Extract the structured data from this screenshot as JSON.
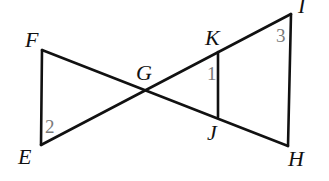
{
  "diagram": {
    "type": "geometry-figure",
    "colors": {
      "line": "#111111",
      "angle_label": "#7a7a7a",
      "background": "#ffffff"
    },
    "points": {
      "F": {
        "label": "F",
        "x": 42,
        "y": 50
      },
      "E": {
        "label": "E",
        "x": 41,
        "y": 145
      },
      "G": {
        "label": "G",
        "x": 146,
        "y": 89
      },
      "K": {
        "label": "K",
        "x": 218,
        "y": 52
      },
      "J": {
        "label": "J",
        "x": 218,
        "y": 117
      },
      "I": {
        "label": "I",
        "x": 291,
        "y": 14
      },
      "H": {
        "label": "H",
        "x": 288,
        "y": 146
      }
    },
    "segments": [
      {
        "from": "F",
        "to": "E"
      },
      {
        "from": "F",
        "to": "H"
      },
      {
        "from": "E",
        "to": "I"
      },
      {
        "from": "K",
        "to": "J"
      },
      {
        "from": "I",
        "to": "H"
      }
    ],
    "angles": [
      {
        "label": "1",
        "at": "K"
      },
      {
        "label": "2",
        "at": "E"
      },
      {
        "label": "3",
        "at": "I"
      }
    ]
  }
}
